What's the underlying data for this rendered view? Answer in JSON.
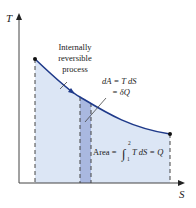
{
  "diagram": {
    "type": "T-S diagram",
    "axes": {
      "y_label": "T",
      "x_label": "S"
    },
    "process_label_lines": [
      "Internally",
      "reversible",
      "process"
    ],
    "strip_label_lines": [
      "dA = T dS",
      "= δQ"
    ],
    "area_label": {
      "prefix": "Area = ",
      "integral_upper": "2",
      "integral_lower": "1",
      "suffix": "T dS = Q"
    },
    "colors": {
      "area_fill": "#dce6f5",
      "strip_fill": "#a9b8e0",
      "curve": "#1f3a8a",
      "axis": "#444444",
      "dashed": "#444444"
    }
  }
}
